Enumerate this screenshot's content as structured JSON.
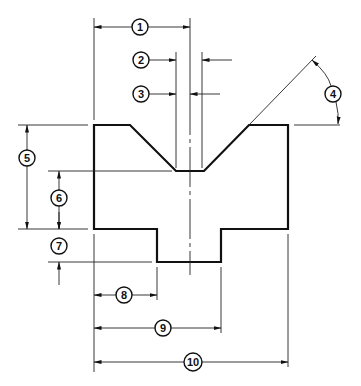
{
  "drawing": {
    "title": "",
    "callouts": [
      {
        "id": "1",
        "label": "1"
      },
      {
        "id": "2",
        "label": "2"
      },
      {
        "id": "3",
        "label": "3"
      },
      {
        "id": "4",
        "label": "4"
      },
      {
        "id": "5",
        "label": "5"
      },
      {
        "id": "6",
        "label": "6"
      },
      {
        "id": "7",
        "label": "7"
      },
      {
        "id": "8",
        "label": "8"
      },
      {
        "id": "9",
        "label": "9"
      },
      {
        "id": "10",
        "label": "10"
      }
    ]
  }
}
